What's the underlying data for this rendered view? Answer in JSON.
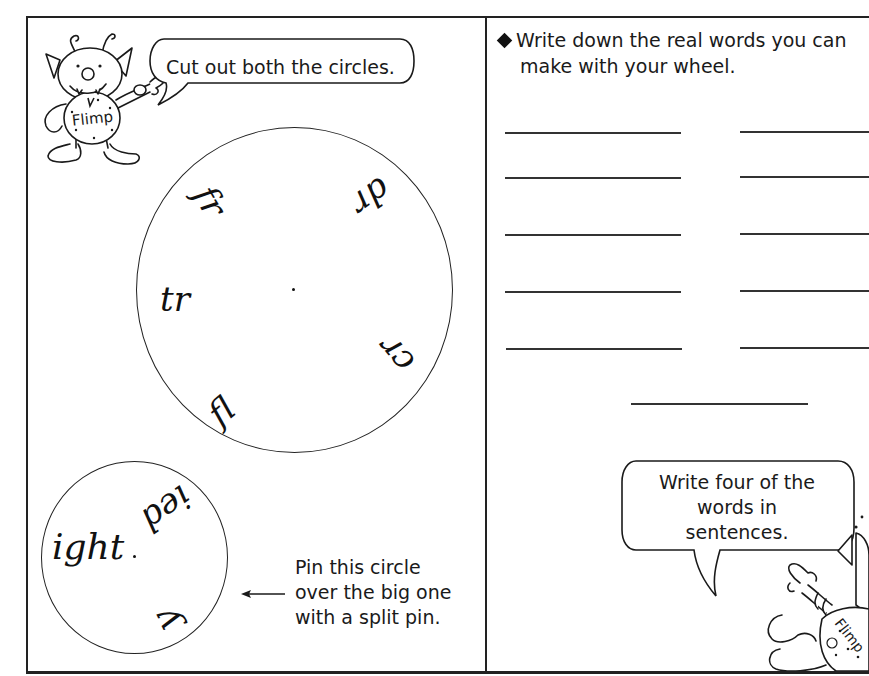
{
  "left_panel": {
    "speech_bubble": "Cut out both the circles.",
    "mascot_name": "Flimp",
    "big_wheel": {
      "segments": [
        {
          "text": "fr",
          "position": "upper-left"
        },
        {
          "text": "dr",
          "position": "upper-right"
        },
        {
          "text": "tr",
          "position": "left"
        },
        {
          "text": "cr",
          "position": "lower-right"
        },
        {
          "text": "fl",
          "position": "lower-left"
        }
      ]
    },
    "small_wheel": {
      "segments": [
        {
          "text": "ight",
          "position": "left"
        },
        {
          "text": "ied",
          "position": "upper-right"
        },
        {
          "text": "y",
          "position": "lower-right"
        }
      ]
    },
    "pin_note": [
      "Pin this circle",
      "over the big one",
      "with a split pin."
    ]
  },
  "right_panel": {
    "instruction_line1": "Write down the real words you can",
    "instruction_line2": "make with your wheel.",
    "answer_lines": {
      "left_column_count": 5,
      "right_column_count": 5,
      "extra_centered_count": 1
    },
    "speech_bubble": [
      "Write four of the",
      "words in",
      "sentences."
    ],
    "mascot_name": "Flimp"
  },
  "colors": {
    "ink": "#1a1a1a",
    "paper": "#ffffff"
  }
}
